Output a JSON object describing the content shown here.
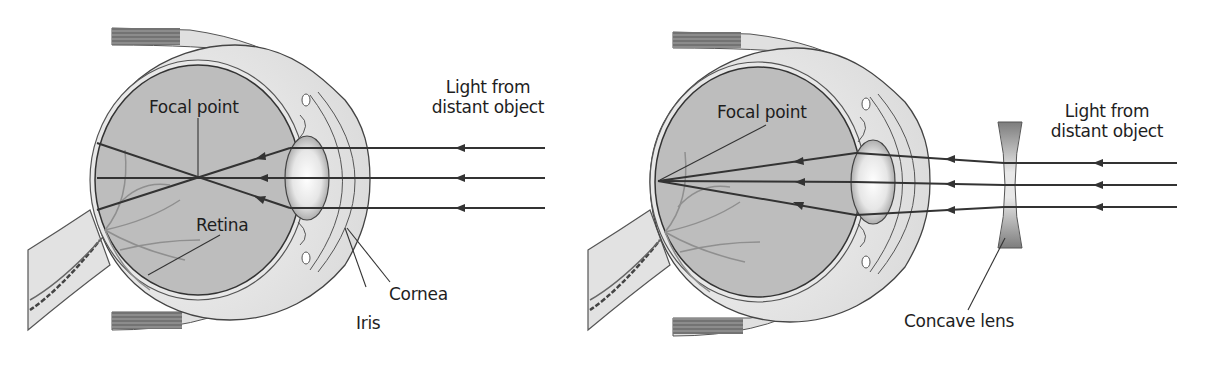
{
  "figure": {
    "panels": [
      {
        "id": "myopic-eye",
        "labels": {
          "focal_point": "Focal point",
          "light_line1": "Light from",
          "light_line2": "distant object",
          "retina": "Retina",
          "cornea": "Cornea",
          "iris": "Iris"
        }
      },
      {
        "id": "corrected-eye",
        "labels": {
          "focal_point": "Focal point",
          "light_line1": "Light from",
          "light_line2": "distant object",
          "concave_lens": "Concave lens"
        }
      }
    ],
    "colors": {
      "eyeball_fill": "#bdbdbd",
      "sclera_fill": "#e4e4e4",
      "outline": "#3a3a3a",
      "ray": "#333333",
      "lens_dark": "#8a8a8a",
      "text": "#1e1e1e"
    }
  }
}
